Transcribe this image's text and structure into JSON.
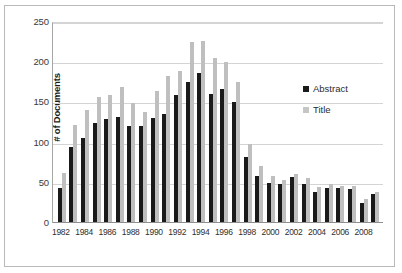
{
  "chart_data": {
    "type": "bar",
    "title": "",
    "subtitle": "",
    "xlabel": "",
    "ylabel": "# of Documents",
    "ylim": [
      0,
      250
    ],
    "ytick_values": [
      250,
      200,
      150,
      100,
      50,
      0
    ],
    "ytick_labels": [
      "250",
      "200",
      "150",
      "100",
      "50",
      "0"
    ],
    "grid": true,
    "legend_position": "inside-right",
    "categories": [
      "1982",
      "1983",
      "1984",
      "1985",
      "1986",
      "1987",
      "1988",
      "1989",
      "1990",
      "1991",
      "1992",
      "1993",
      "1994",
      "1995",
      "1996",
      "1997",
      "1998",
      "1999",
      "2000",
      "2001",
      "2002",
      "2003",
      "2004",
      "2005",
      "2006",
      "2007",
      "2008",
      "2009"
    ],
    "xtick_labels": [
      "1982",
      "",
      "1984",
      "",
      "1986",
      "",
      "1988",
      "",
      "1990",
      "",
      "1992",
      "",
      "1994",
      "",
      "1996",
      "",
      "1998",
      "",
      "2000",
      "",
      "2002",
      "",
      "2004",
      "",
      "2006",
      "",
      "2008",
      ""
    ],
    "series": [
      {
        "name": "Abstract",
        "color": "#1a1a1a",
        "values": [
          43,
          95,
          106,
          124,
          129,
          132,
          121,
          121,
          130,
          136,
          159,
          176,
          187,
          161,
          167,
          150,
          82,
          59,
          50,
          48,
          57,
          48,
          38,
          43,
          44,
          42,
          25,
          36
        ]
      },
      {
        "name": "Title",
        "color": "#bfbfbf",
        "values": [
          62,
          122,
          141,
          157,
          159,
          169,
          149,
          138,
          164,
          183,
          189,
          225,
          226,
          205,
          200,
          176,
          98,
          71,
          59,
          53,
          61,
          56,
          45,
          48,
          46,
          46,
          30,
          39
        ]
      }
    ]
  },
  "legend": {
    "items": [
      {
        "label": "Abstract"
      },
      {
        "label": "Title"
      }
    ]
  }
}
